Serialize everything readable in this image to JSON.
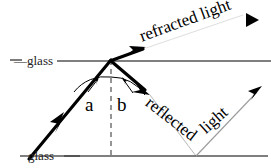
{
  "figure": {
    "width": 271,
    "height": 168,
    "background": "#ffffff",
    "line_color": "#000000",
    "surface_color": "#555555",
    "normal_color": "#888888",
    "thin_ray_color": "#999999"
  },
  "labels": {
    "glass_top": "—glass",
    "glass_bottom": "glass",
    "angle_a": "a",
    "angle_b": "b",
    "refracted": "refracted light",
    "reflected": "reflected",
    "light": "light"
  },
  "geometry": {
    "top_surface_y": 61,
    "bottom_surface_y": 156,
    "incidence_point": {
      "x": 111,
      "y": 60
    },
    "reflection_point": {
      "x": 196,
      "y": 156
    },
    "normal_line": {
      "x": 111,
      "y1": 60,
      "y2": 156
    },
    "incident_ray": {
      "x1": 30,
      "y1": 158,
      "x2": 111,
      "y2": 60
    },
    "refracted_ray": {
      "x1": 111,
      "y1": 60,
      "x2": 255,
      "y2": 13
    },
    "reflected_ray": {
      "x1": 111,
      "y1": 60,
      "x2": 196,
      "y2": 156
    },
    "exit_ray": {
      "x1": 196,
      "y1": 156,
      "x2": 262,
      "y2": 87
    }
  },
  "icons": {
    "incident_arrow": "arrow-up-right",
    "refracted_arrow": "arrow-up-right",
    "refracted_tip_arrow": "arrow-right-triangle",
    "reflected_arrow": "arrow-down-right",
    "exit_arrow": "arrow-up-right",
    "angle_arc_a": "angle-arc-arrow",
    "angle_arc_b": "angle-arc-arrow"
  }
}
